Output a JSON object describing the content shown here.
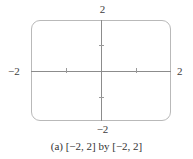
{
  "figure": {
    "caption": "(a) [−2, 2] by [−2, 2]",
    "frame_color": "#b9b9b9",
    "axis_color": "#8c8c8c",
    "background": "#ffffff",
    "axis_labels": {
      "top": "2",
      "bottom": "−2",
      "left": "−2",
      "right": "2"
    }
  },
  "chart_data": {
    "type": "scatter",
    "title": "(a) [−2, 2] by [−2, 2]",
    "xlabel": "",
    "ylabel": "",
    "xlim": [
      -2,
      2
    ],
    "ylim": [
      -2,
      2
    ],
    "xticks": [
      -1,
      1
    ],
    "yticks": [
      -1,
      1
    ],
    "xticklabels": [
      "",
      ""
    ],
    "yticklabels": [
      "",
      ""
    ],
    "boundary_labels": {
      "xmin": "−2",
      "xmax": "2",
      "ymin": "−2",
      "ymax": "2"
    },
    "grid": false,
    "legend": null,
    "series": [],
    "annotations": [
      "(a) [−2, 2] by [−2, 2]"
    ]
  }
}
